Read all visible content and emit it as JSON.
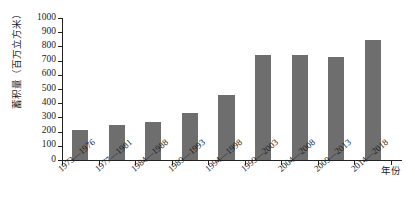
{
  "chart_data": {
    "type": "bar",
    "title": "",
    "xlabel": "年份",
    "ylabel": "蓄积量（百万立方米）",
    "categories": [
      "1973—1976",
      "1977—1981",
      "1984—1988",
      "1989—1993",
      "1994—1998",
      "1999—2003",
      "2004—2008",
      "2009—2013",
      "2014—2018"
    ],
    "values": [
      210,
      245,
      265,
      330,
      460,
      742,
      740,
      725,
      848
    ],
    "ylim": [
      0,
      1000
    ],
    "yticks": [
      0,
      100,
      200,
      300,
      400,
      500,
      600,
      700,
      800,
      900,
      1000
    ],
    "ytick_labels": [
      "0",
      "100",
      "200",
      "300",
      "400",
      "500",
      "600",
      "700",
      "800",
      "900",
      "1000"
    ],
    "grid": false,
    "legend": false,
    "bar_color": "#6e6e6e",
    "axis_color": "#222222"
  }
}
